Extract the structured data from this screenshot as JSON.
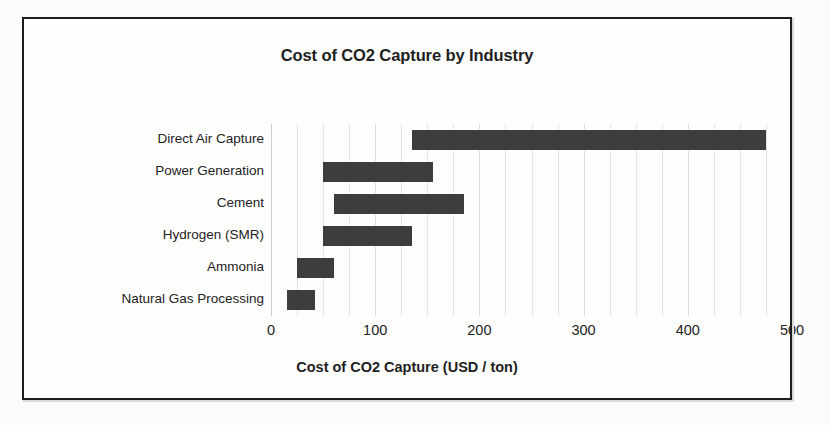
{
  "chart_data": {
    "type": "bar",
    "orientation": "horizontal",
    "style": "floating-range-bar",
    "title": "Cost of CO2 Capture by Industry",
    "xlabel": "Cost of CO2 Capture (USD / ton)",
    "ylabel": "",
    "xlim": [
      0,
      500
    ],
    "xticks": [
      0,
      100,
      200,
      300,
      400,
      500
    ],
    "xtick_labels": [
      "0",
      "100",
      "200",
      "300",
      "400",
      "500"
    ],
    "grid": true,
    "grid_axis": "x",
    "grid_minor_step": 25,
    "legend": "none",
    "categories": [
      "Direct Air Capture",
      "Power Generation",
      "Cement",
      "Hydrogen (SMR)",
      "Ammonia",
      "Natural Gas Processing"
    ],
    "series": [
      {
        "name": "low",
        "values": [
          135,
          50,
          60,
          50,
          25,
          15
        ]
      },
      {
        "name": "high",
        "values": [
          475,
          155,
          185,
          135,
          60,
          42
        ]
      }
    ],
    "ranges": [
      {
        "category": "Direct Air Capture",
        "low": 135,
        "high": 475
      },
      {
        "category": "Power Generation",
        "low": 50,
        "high": 155
      },
      {
        "category": "Cement",
        "low": 60,
        "high": 185
      },
      {
        "category": "Hydrogen (SMR)",
        "low": 50,
        "high": 135
      },
      {
        "category": "Ammonia",
        "low": 25,
        "high": 60
      },
      {
        "category": "Natural Gas Processing",
        "low": 15,
        "high": 42
      }
    ],
    "units": "USD / ton",
    "bar_color": "#3d3d3d",
    "grid_color": "#e3e3e1",
    "text_color": "#232323",
    "background": "#fdfdfc"
  }
}
